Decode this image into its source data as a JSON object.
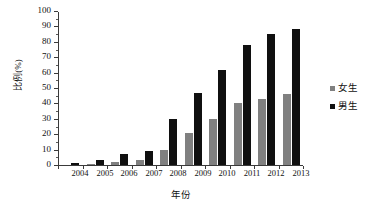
{
  "chart_data": {
    "type": "bar",
    "title": "",
    "xlabel": "年份",
    "ylabel": "比例(%)",
    "categories": [
      "2004",
      "2005",
      "2006",
      "2007",
      "2008",
      "2009",
      "2010",
      "2011",
      "2012",
      "2013"
    ],
    "series": [
      {
        "name": "女生",
        "color": "#808080",
        "values": [
          0,
          0.5,
          2,
          3,
          10,
          21,
          30,
          40,
          43,
          46
        ]
      },
      {
        "name": "男生",
        "color": "#101010",
        "values": [
          1,
          3,
          7,
          9,
          30,
          47,
          62,
          78,
          85,
          88
        ]
      }
    ],
    "ylim": [
      0,
      100
    ],
    "ytick_labels": [
      "0",
      "10",
      "20",
      "30",
      "40",
      "50",
      "60",
      "70",
      "80",
      "90",
      "100"
    ],
    "ytick_values": [
      0,
      10,
      20,
      30,
      40,
      50,
      60,
      70,
      80,
      90,
      100
    ],
    "grid": false,
    "legend_position": "right"
  },
  "legend": {
    "entries": [
      {
        "label": "女生"
      },
      {
        "label": "男生"
      }
    ]
  }
}
